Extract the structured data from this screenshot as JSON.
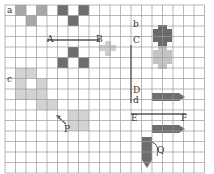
{
  "diagram": {
    "title": "",
    "grid": {
      "x0": 5,
      "y0": 5,
      "cell": 10.5,
      "cols": 19,
      "rows": 16
    },
    "colors": {
      "grid_line": "#9a9a9a",
      "dark_fill": "#6e6e6e",
      "mid_fill": "#a8a8a8",
      "light_fill": "#d3d3d3",
      "pale_fill": "#e4e4e4",
      "segment": "#555555"
    },
    "labels": [
      {
        "id": "a",
        "text": "a",
        "x": 7,
        "y": 6
      },
      {
        "id": "A",
        "text": "A",
        "x": 47,
        "y": 35
      },
      {
        "id": "B",
        "text": "B",
        "x": 96,
        "y": 35
      },
      {
        "id": "b",
        "text": "b",
        "x": 133,
        "y": 20
      },
      {
        "id": "C",
        "text": "C",
        "x": 133,
        "y": 36
      },
      {
        "id": "c",
        "text": "c",
        "x": 7,
        "y": 75
      },
      {
        "id": "D",
        "text": "D",
        "x": 133,
        "y": 86
      },
      {
        "id": "d",
        "text": "d",
        "x": 133,
        "y": 96
      },
      {
        "id": "E",
        "text": "E",
        "x": 131,
        "y": 114
      },
      {
        "id": "F",
        "text": "F",
        "x": 181,
        "y": 114
      },
      {
        "id": "P",
        "text": "P",
        "x": 64,
        "y": 125
      },
      {
        "id": "Q",
        "text": "Q",
        "x": 157,
        "y": 146
      }
    ],
    "top_squares": [
      {
        "col": 1,
        "row": 0,
        "fill": "mid_fill"
      },
      {
        "col": 3,
        "row": 0,
        "fill": "mid_fill"
      },
      {
        "col": 5,
        "row": 0,
        "fill": "dark_fill"
      },
      {
        "col": 7,
        "row": 0,
        "fill": "dark_fill"
      },
      {
        "col": 2,
        "row": 1,
        "fill": "mid_fill"
      },
      {
        "col": 6,
        "row": 1,
        "fill": "dark_fill"
      }
    ],
    "ab_squares": [
      {
        "col": 6,
        "row": 4,
        "fill": "dark_fill"
      },
      {
        "col": 5,
        "row": 5,
        "fill": "dark_fill"
      },
      {
        "col": 7,
        "row": 5,
        "fill": "dark_fill"
      }
    ],
    "c_shape": [
      {
        "col": 1,
        "row": 6
      },
      {
        "col": 2,
        "row": 6
      },
      {
        "col": 1,
        "row": 7
      },
      {
        "col": 3,
        "row": 7
      },
      {
        "col": 1,
        "row": 8
      },
      {
        "col": 2,
        "row": 8
      },
      {
        "col": 3,
        "row": 8
      },
      {
        "col": 3,
        "row": 9
      },
      {
        "col": 4,
        "row": 9
      },
      {
        "col": 6,
        "row": 10
      },
      {
        "col": 7,
        "row": 10
      },
      {
        "col": 6,
        "row": 11
      },
      {
        "col": 7,
        "row": 11
      }
    ],
    "segments": [
      {
        "id": "AB",
        "x1": 47,
        "y1": 40,
        "x2": 100,
        "y2": 40
      },
      {
        "id": "CD",
        "x1": 131,
        "y1": 45,
        "x2": 131,
        "y2": 103
      },
      {
        "id": "EF",
        "x1": 131,
        "y1": 114,
        "x2": 186,
        "y2": 114
      }
    ]
  }
}
